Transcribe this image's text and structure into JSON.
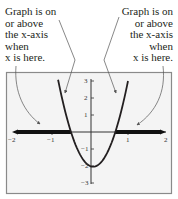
{
  "annotations": {
    "left": {
      "lines": [
        "Graph is on",
        "or above",
        "the x-axis",
        "when",
        "x is here."
      ]
    },
    "right": {
      "lines": [
        "Graph is on",
        "or above",
        "the x-axis",
        "when",
        "x is here."
      ]
    }
  },
  "axes": {
    "x_ticks": [
      "−2",
      "−1",
      "1",
      "2"
    ],
    "y_ticks": [
      "3",
      "2",
      "1",
      "−1",
      "−2",
      "−3"
    ]
  },
  "colors": {
    "curve": "#231f20",
    "solution_band": "#111111",
    "arrows": "#555555",
    "frame": "#8a8a8a",
    "background": "#f4f4f4"
  },
  "chart_data": {
    "type": "line",
    "title": "",
    "xlabel": "",
    "ylabel": "",
    "xlim": [
      -2,
      2
    ],
    "ylim": [
      -3,
      3
    ],
    "grid": false,
    "function": "y = 6x^2 - x - 2",
    "x_ticks": [
      -2,
      -1,
      1,
      2
    ],
    "y_ticks": [
      -3,
      -2,
      -1,
      1,
      2,
      3
    ],
    "x_intercepts": [
      -0.5,
      0.6667
    ],
    "vertex": {
      "x": 0.083,
      "y": -2.04
    },
    "series": [
      {
        "name": "parabola",
        "x": [
          -0.84,
          -0.75,
          -0.6,
          -0.5,
          -0.4,
          -0.25,
          -0.1,
          0.0,
          0.083,
          0.2,
          0.35,
          0.5,
          0.6667,
          0.8,
          0.9,
          1.0
        ],
        "y": [
          3.07,
          2.13,
          0.76,
          0.0,
          -0.64,
          -1.38,
          -1.84,
          -2.0,
          -2.04,
          -1.96,
          -1.62,
          -1.0,
          0.0,
          1.04,
          1.96,
          3.0
        ]
      }
    ],
    "shaded_intervals": [
      {
        "from": -2,
        "to": -0.5,
        "label": "Graph is on or above the x-axis when x is here."
      },
      {
        "from": 0.6667,
        "to": 2,
        "label": "Graph is on or above the x-axis when x is here."
      }
    ],
    "annotations": [
      {
        "text": "Graph is on or above the x-axis when x is here.",
        "position": "top-left",
        "arrows_to": [
          "left band",
          "left branch of curve"
        ]
      },
      {
        "text": "Graph is on or above the x-axis when x is here.",
        "position": "top-right",
        "arrows_to": [
          "right branch of curve",
          "right band"
        ]
      }
    ]
  }
}
